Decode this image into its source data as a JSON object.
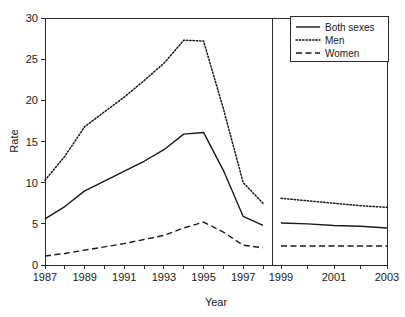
{
  "chart_data": {
    "type": "line",
    "title": "",
    "xlabel": "Year",
    "ylabel": "Rate",
    "xlim": [
      1987,
      2003
    ],
    "ylim": [
      0,
      30
    ],
    "yticks": [
      0,
      5,
      10,
      15,
      20,
      25,
      30
    ],
    "xticks": [
      1987,
      1988,
      1989,
      1990,
      1991,
      1992,
      1993,
      1994,
      1995,
      1996,
      1997,
      1998,
      1999,
      2000,
      2001,
      2002,
      2003
    ],
    "xtick_labels": [
      "1987",
      "",
      "1989",
      "",
      "1991",
      "",
      "1993",
      "",
      "1995",
      "",
      "1997",
      "",
      "1999",
      "",
      "2001",
      "",
      "2003"
    ],
    "ytick_labels": [
      "0",
      "5",
      "10",
      "15",
      "20",
      "25",
      "30"
    ],
    "grid": false,
    "legend_position": "top-right",
    "panel_break": {
      "after_x": 1998,
      "before_x": 1999,
      "note": "vertical divider separating 1987-1998 panel from 1999-2003 panel"
    },
    "x_left_panel": [
      1987,
      1988,
      1989,
      1990,
      1991,
      1992,
      1993,
      1994,
      1995,
      1996,
      1997,
      1998
    ],
    "x_right_panel": [
      1999,
      2000,
      2001,
      2002,
      2003
    ],
    "series": [
      {
        "name": "Both sexes",
        "style": "solid",
        "left_values": [
          5.6,
          7.1,
          9.0,
          10.2,
          11.4,
          12.6,
          14.0,
          15.9,
          16.1,
          11.5,
          5.9,
          4.8
        ],
        "right_values": [
          5.1,
          5.0,
          4.8,
          4.7,
          4.5
        ]
      },
      {
        "name": "Men",
        "style": "dotted",
        "left_values": [
          10.3,
          13.2,
          16.8,
          18.6,
          20.4,
          22.4,
          24.5,
          27.3,
          27.2,
          19.0,
          10.0,
          7.5
        ],
        "right_values": [
          8.1,
          7.8,
          7.5,
          7.2,
          7.0
        ]
      },
      {
        "name": "Women",
        "style": "dashed",
        "left_values": [
          1.1,
          1.4,
          1.8,
          2.2,
          2.6,
          3.1,
          3.6,
          4.5,
          5.2,
          4.0,
          2.4,
          2.1
        ],
        "right_values": [
          2.3,
          2.3,
          2.3,
          2.3,
          2.3
        ]
      }
    ]
  },
  "legend": {
    "entries": [
      {
        "label": "Both sexes"
      },
      {
        "label": "Men"
      },
      {
        "label": "Women"
      }
    ]
  },
  "colors": {
    "ink": "#1a1a1a",
    "axis": "#2b2b2b",
    "background": "#ffffff"
  }
}
